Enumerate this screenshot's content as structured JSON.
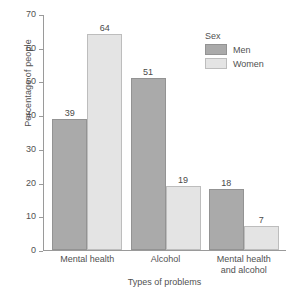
{
  "chart_data": {
    "type": "bar",
    "title": "",
    "categories": [
      "Mental health",
      "Alcohol",
      "Mental health and alcohol"
    ],
    "category_lines": [
      [
        "Mental health"
      ],
      [
        "Alcohol"
      ],
      [
        "Mental health",
        "and alcohol"
      ]
    ],
    "series": [
      {
        "name": "Men",
        "values": [
          39,
          51,
          18
        ],
        "color": "#aaaaaa"
      },
      {
        "name": "Women",
        "values": [
          64,
          19,
          7
        ],
        "color": "#e4e4e4"
      }
    ],
    "xlabel": "Types of problems",
    "ylabel": "Percentage of people",
    "ylim": [
      0,
      70
    ],
    "yticks": [
      0,
      10,
      20,
      30,
      40,
      50,
      60,
      70
    ],
    "ytick_labels": [
      "0",
      "10",
      "20",
      "30",
      "40",
      "50",
      "60",
      "70"
    ],
    "grid": false,
    "legend": {
      "title": "Sex",
      "position": "top-right",
      "entries": [
        "Men",
        "Women"
      ]
    }
  },
  "legend": {
    "title": "Sex",
    "items": [
      {
        "label": "Men",
        "swatch": "men"
      },
      {
        "label": "Women",
        "swatch": "women"
      }
    ]
  },
  "axes": {
    "y_title": "Percentage of people",
    "x_title": "Types of problems"
  },
  "caption": {
    "sliver": ""
  }
}
